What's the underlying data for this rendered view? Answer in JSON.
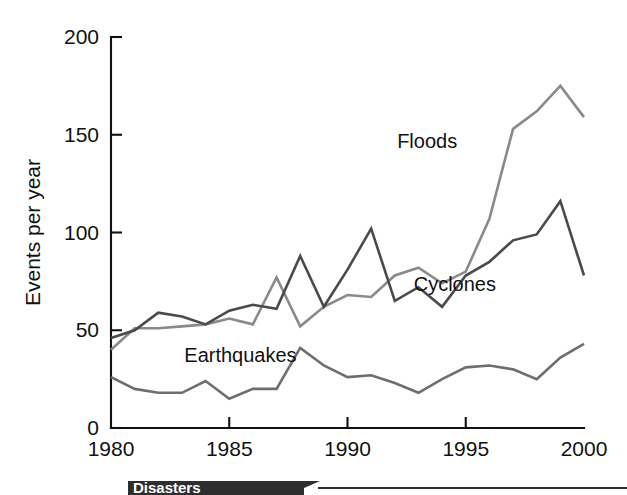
{
  "chart_data": {
    "type": "line",
    "title": "",
    "xlabel": "",
    "ylabel": "Events per year",
    "xlim": [
      1980,
      2000
    ],
    "ylim": [
      0,
      200
    ],
    "grid": false,
    "legend_position": "inline-annotations",
    "x": [
      1980,
      1981,
      1982,
      1983,
      1984,
      1985,
      1986,
      1987,
      1988,
      1989,
      1990,
      1991,
      1992,
      1993,
      1994,
      1995,
      1996,
      1997,
      1998,
      1999,
      2000
    ],
    "xticks": [
      1980,
      1985,
      1990,
      1995,
      2000
    ],
    "xtick_labels": [
      "1980",
      "1985",
      "1990",
      "1995",
      "2000"
    ],
    "yticks": [
      0,
      50,
      100,
      150,
      200
    ],
    "ytick_labels": [
      "0",
      "50",
      "100",
      "150",
      "200"
    ],
    "series": [
      {
        "name": "Floods",
        "color": "#8a8a8a",
        "label_x": 1992.1,
        "label_y": 143,
        "values": [
          40,
          51,
          51,
          52,
          53,
          56,
          53,
          77,
          52,
          62,
          68,
          67,
          78,
          82,
          74,
          80,
          107,
          153,
          162,
          175,
          159
        ]
      },
      {
        "name": "Cyclones",
        "color": "#4a4a4a",
        "label_x": 1992.8,
        "label_y": 70,
        "values": [
          46,
          50,
          59,
          57,
          53,
          60,
          63,
          61,
          88,
          62,
          81,
          102,
          65,
          72,
          62,
          78,
          85,
          96,
          99,
          116,
          78
        ]
      },
      {
        "name": "Earthquakes",
        "color": "#6e6e6e",
        "label_x": 1983.1,
        "label_y": 34,
        "values": [
          26,
          20,
          18,
          18,
          24,
          15,
          20,
          20,
          41,
          32,
          26,
          27,
          23,
          18,
          25,
          31,
          32,
          30,
          25,
          36,
          43
        ]
      }
    ]
  },
  "banner": {
    "text": "Disasters",
    "color": "#2e2e2e"
  }
}
